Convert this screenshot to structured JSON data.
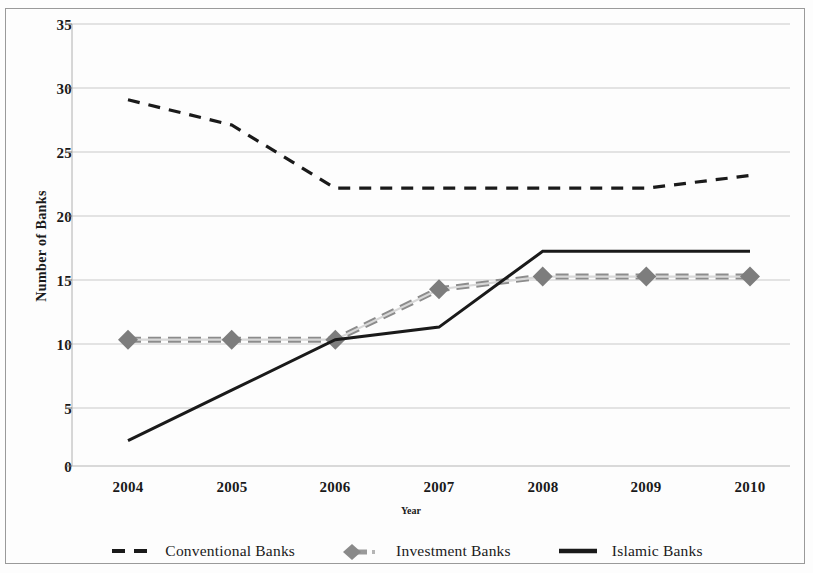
{
  "chart_data": {
    "type": "line",
    "title": "",
    "xlabel": "Year",
    "ylabel": "Number of  Banks",
    "x": [
      2004,
      2005,
      2006,
      2007,
      2008,
      2009,
      2010
    ],
    "categories": [
      "2004",
      "2005",
      "2006",
      "2007",
      "2008",
      "2009",
      "2010"
    ],
    "xlim": [
      2004,
      2010
    ],
    "ylim": [
      0,
      35
    ],
    "yticks": [
      0,
      5,
      10,
      15,
      20,
      25,
      30,
      35
    ],
    "ytick_labels": [
      "0",
      "5",
      "10",
      "15",
      "20",
      "25",
      "30",
      "35"
    ],
    "grid": true,
    "grid_axis": "y",
    "legend_position": "bottom",
    "series": [
      {
        "name": "Conventional Banks",
        "values": [
          29,
          27,
          22,
          22,
          22,
          22,
          23
        ],
        "style": "dashed",
        "color": "#1a1a1a",
        "marker": "none"
      },
      {
        "name": "Investment Banks",
        "values": [
          10,
          10,
          10,
          14,
          15,
          15,
          15
        ],
        "style": "dashed-thick",
        "color": "#8c8c8c",
        "marker": "diamond"
      },
      {
        "name": "Islamic Banks",
        "values": [
          2,
          6,
          10,
          11,
          17,
          17,
          17
        ],
        "style": "solid",
        "color": "#1a1a1a",
        "marker": "none"
      }
    ]
  },
  "axes": {
    "y_title": "Number of  Banks",
    "x_title": "Year",
    "y_ticks": [
      "35",
      "30",
      "25",
      "20",
      "15",
      "10",
      "5",
      "0"
    ],
    "x_ticks": [
      "2004",
      "2005",
      "2006",
      "2007",
      "2008",
      "2009",
      "2010"
    ]
  },
  "legend": {
    "items": [
      {
        "label": "Conventional Banks",
        "swatch": "dashed-line-swatch"
      },
      {
        "label": "Investment Banks",
        "swatch": "diamond-marker-swatch"
      },
      {
        "label": "Islamic Banks",
        "swatch": "solid-line-swatch"
      }
    ]
  }
}
